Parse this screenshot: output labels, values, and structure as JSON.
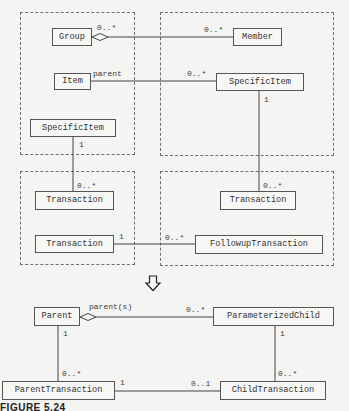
{
  "packages": [
    {
      "id": "pkg-top-left"
    },
    {
      "id": "pkg-top-right"
    },
    {
      "id": "pkg-bottom-left"
    },
    {
      "id": "pkg-bottom-right"
    }
  ],
  "before": {
    "classes": {
      "group": "Group",
      "member": "Member",
      "item": "Item",
      "specific_item_right": "SpecificItem",
      "specific_item_left": "SpecificItem",
      "transaction_left_top": "Transaction",
      "transaction_right": "Transaction",
      "transaction_left_bottom": "Transaction",
      "followup_transaction": "FollowupTransaction"
    },
    "associations": [
      {
        "from": "Group",
        "to": "Member",
        "kind": "aggregation",
        "from_mult": "0..*",
        "to_mult": "0..*"
      },
      {
        "from": "Item",
        "to": "SpecificItem",
        "kind": "association",
        "from_role": "parent",
        "to_mult": "0..*"
      },
      {
        "from": "SpecificItem",
        "to": "Transaction",
        "kind": "association",
        "from_mult": "1",
        "to_mult": "0..*",
        "side": "right"
      },
      {
        "from": "SpecificItem",
        "to": "Transaction",
        "kind": "association",
        "from_mult": "1",
        "to_mult": "0..*",
        "side": "left"
      },
      {
        "from": "Transaction",
        "to": "FollowupTransaction",
        "kind": "association",
        "from_mult": "1",
        "to_mult": "0..*"
      }
    ],
    "labels": {
      "group_mult": "0..*",
      "member_mult": "0..*",
      "item_role": "parent",
      "specific_right_mult_in": "0..*",
      "specific_right_mult_down": "1",
      "transaction_right_mult": "0..*",
      "specific_left_mult_down": "1",
      "transaction_left_mult": "0..*",
      "transaction_bottom_mult": "1",
      "followup_mult": "0..*"
    }
  },
  "transform_arrow": "down-arrow",
  "after": {
    "classes": {
      "parent": "Parent",
      "parameterized_child": "ParameterizedChild",
      "parent_transaction": "ParentTransaction",
      "child_transaction": "ChildTransaction"
    },
    "associations": [
      {
        "from": "Parent",
        "to": "ParameterizedChild",
        "kind": "aggregation",
        "from_role": "parent(s)",
        "to_mult": "0..*"
      },
      {
        "from": "Parent",
        "to": "ParentTransaction",
        "kind": "association",
        "from_mult": "1",
        "to_mult": "0..*"
      },
      {
        "from": "ParameterizedChild",
        "to": "ChildTransaction",
        "kind": "association",
        "from_mult": "1",
        "to_mult": "0..*"
      },
      {
        "from": "ParentTransaction",
        "to": "ChildTransaction",
        "kind": "association",
        "from_mult": "1",
        "to_mult": "0..1"
      }
    ],
    "labels": {
      "parent_role": "parent(s)",
      "param_child_mult": "0..*",
      "parent_mult_down": "1",
      "parent_tx_mult_up": "0..*",
      "param_child_mult_down": "1",
      "child_tx_mult_up": "0..*",
      "parent_tx_mult_right": "1",
      "child_tx_mult_left": "0..1"
    }
  },
  "caption": "FIGURE 5.24"
}
